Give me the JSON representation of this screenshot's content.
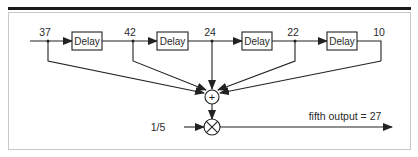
{
  "diagram": {
    "title_bar_color": "#1a1a1a",
    "frame_color": "#c8c8c8",
    "stages": [
      {
        "tap_value": "37",
        "block_label": "Delay"
      },
      {
        "tap_value": "42",
        "block_label": "Delay"
      },
      {
        "tap_value": "24",
        "block_label": "Delay"
      },
      {
        "tap_value": "22",
        "block_label": "Delay"
      },
      {
        "tap_value": "10",
        "block_label": null
      }
    ],
    "sum_node_symbol": "+",
    "multiplier_input": "1/5",
    "output_label": "fifth output = 27"
  }
}
